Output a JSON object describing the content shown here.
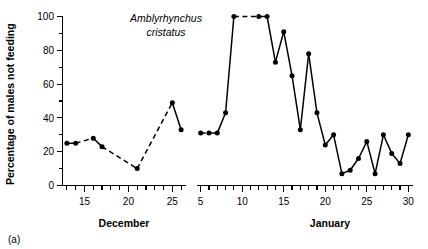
{
  "figure": {
    "panel_label": "(a)",
    "annotation_line1": "Amblyrhynchus",
    "annotation_line2": "cristatus"
  },
  "chart_data": {
    "type": "line",
    "title": "",
    "subtitle": "",
    "annotation": "Amblyrhynchus cristatus",
    "panel_label": "(a)",
    "xlabel": "",
    "ylabel": "Percentage of males not feeding",
    "ylim": [
      0,
      100
    ],
    "yticks": [
      0,
      20,
      40,
      60,
      80,
      100
    ],
    "ytick_labels": [
      "0",
      "20",
      "40",
      "60",
      "80",
      "100"
    ],
    "y_minor_tick_step": 10,
    "grid": false,
    "legend": false,
    "legend_position": "none",
    "marker": "filled-circle",
    "line_color": "#000000",
    "panels": [
      {
        "name": "december",
        "xlabel": "December",
        "xlim": [
          12.5,
          26.5
        ],
        "xticks": [
          15,
          20,
          25
        ],
        "xtick_labels": [
          "15",
          "20",
          "25"
        ],
        "x_minor_tick_step": 1,
        "x": [
          13,
          14,
          16,
          17,
          21,
          25,
          26
        ],
        "y": [
          25,
          25,
          28,
          23,
          10,
          49,
          33
        ],
        "segments": [
          {
            "x": [
              13,
              14
            ],
            "y": [
              25,
              25
            ],
            "style": "solid"
          },
          {
            "x": [
              14,
              16
            ],
            "y": [
              25,
              28
            ],
            "style": "dashed"
          },
          {
            "x": [
              16,
              17
            ],
            "y": [
              28,
              23
            ],
            "style": "solid"
          },
          {
            "x": [
              17,
              21
            ],
            "y": [
              23,
              10
            ],
            "style": "dashed"
          },
          {
            "x": [
              21,
              25
            ],
            "y": [
              10,
              49
            ],
            "style": "dashed"
          },
          {
            "x": [
              25,
              26
            ],
            "y": [
              49,
              33
            ],
            "style": "solid"
          }
        ]
      },
      {
        "name": "january",
        "xlabel": "January",
        "xlim": [
          4.5,
          30.5
        ],
        "xticks": [
          5,
          10,
          15,
          20,
          25,
          30
        ],
        "xtick_labels": [
          "5",
          "10",
          "15",
          "20",
          "25",
          "30"
        ],
        "x_minor_tick_step": 1,
        "x": [
          5,
          6,
          7,
          8,
          9,
          12,
          13,
          14,
          15,
          16,
          17,
          18,
          19,
          20,
          21,
          22,
          23,
          24,
          25,
          26,
          27,
          28,
          29,
          30
        ],
        "y": [
          31,
          31,
          31,
          43,
          100,
          100,
          100,
          73,
          91,
          65,
          33,
          78,
          43,
          24,
          30,
          7,
          9,
          16,
          26,
          7,
          30,
          19,
          13,
          30
        ],
        "segments": [
          {
            "x": [
              5,
              6
            ],
            "y": [
              31,
              31
            ],
            "style": "dashed"
          },
          {
            "x": [
              6,
              7
            ],
            "y": [
              31,
              31
            ],
            "style": "solid"
          },
          {
            "x": [
              7,
              8
            ],
            "y": [
              31,
              43
            ],
            "style": "solid"
          },
          {
            "x": [
              8,
              9
            ],
            "y": [
              43,
              100
            ],
            "style": "solid"
          },
          {
            "x": [
              9,
              12
            ],
            "y": [
              100,
              100
            ],
            "style": "dashed"
          },
          {
            "x": [
              12,
              13
            ],
            "y": [
              100,
              100
            ],
            "style": "solid"
          },
          {
            "x": [
              13,
              14
            ],
            "y": [
              100,
              73
            ],
            "style": "solid"
          },
          {
            "x": [
              14,
              15
            ],
            "y": [
              73,
              91
            ],
            "style": "solid"
          },
          {
            "x": [
              15,
              16
            ],
            "y": [
              91,
              65
            ],
            "style": "solid"
          },
          {
            "x": [
              16,
              17
            ],
            "y": [
              65,
              33
            ],
            "style": "solid"
          },
          {
            "x": [
              17,
              18
            ],
            "y": [
              33,
              78
            ],
            "style": "solid"
          },
          {
            "x": [
              18,
              19
            ],
            "y": [
              78,
              43
            ],
            "style": "solid"
          },
          {
            "x": [
              19,
              20
            ],
            "y": [
              43,
              24
            ],
            "style": "solid"
          },
          {
            "x": [
              20,
              21
            ],
            "y": [
              24,
              30
            ],
            "style": "solid"
          },
          {
            "x": [
              21,
              22
            ],
            "y": [
              30,
              7
            ],
            "style": "solid"
          },
          {
            "x": [
              22,
              23
            ],
            "y": [
              7,
              9
            ],
            "style": "solid"
          },
          {
            "x": [
              23,
              24
            ],
            "y": [
              9,
              16
            ],
            "style": "solid"
          },
          {
            "x": [
              24,
              25
            ],
            "y": [
              16,
              26
            ],
            "style": "solid"
          },
          {
            "x": [
              25,
              26
            ],
            "y": [
              26,
              7
            ],
            "style": "solid"
          },
          {
            "x": [
              26,
              27
            ],
            "y": [
              7,
              30
            ],
            "style": "solid"
          },
          {
            "x": [
              27,
              28
            ],
            "y": [
              30,
              19
            ],
            "style": "solid"
          },
          {
            "x": [
              28,
              29
            ],
            "y": [
              19,
              13
            ],
            "style": "solid"
          },
          {
            "x": [
              29,
              30
            ],
            "y": [
              13,
              30
            ],
            "style": "solid"
          }
        ]
      }
    ]
  }
}
